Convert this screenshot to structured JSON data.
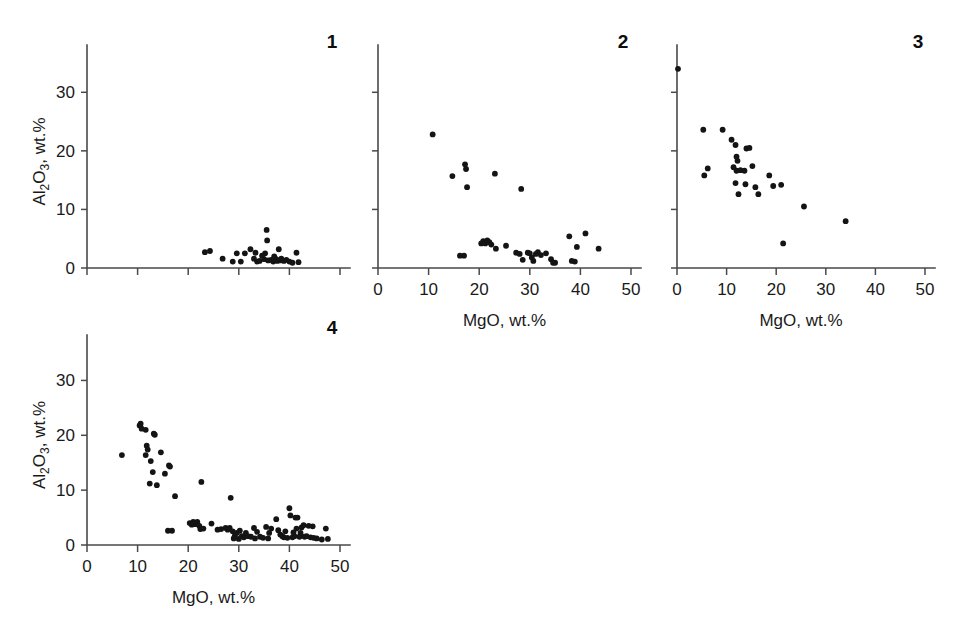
{
  "figure": {
    "title": "",
    "axis_labels": {
      "x": "MgO, wt.%",
      "y_prefix": "Al",
      "y_sub1": "2",
      "y_mid": "O",
      "y_sub2": "3",
      "y_suffix": ", wt.%"
    },
    "y_axis_label_full": "Al2O3, wt.%",
    "x_axis_label_full": "MgO, wt.%"
  },
  "chart_data": [
    {
      "type": "scatter",
      "title": "1",
      "panel_number": "1",
      "xlabel": "",
      "ylabel": "Al2O3, wt.%",
      "xlim": [
        0,
        50
      ],
      "ylim": [
        0,
        35
      ],
      "xticks": [
        0,
        10,
        20,
        30,
        40,
        50
      ],
      "xticklabels": [
        "",
        "",
        "",
        "",
        "",
        ""
      ],
      "yticks": [
        0,
        10,
        20,
        30
      ],
      "yticklabels": [
        "0",
        "10",
        "20",
        "30"
      ],
      "grid": false,
      "legend": "none",
      "points": [
        [
          23.3,
          2.7
        ],
        [
          24.3,
          2.9
        ],
        [
          26.8,
          1.6
        ],
        [
          28.8,
          1.1
        ],
        [
          29.6,
          2.5
        ],
        [
          31.2,
          2.5
        ],
        [
          32.3,
          3.2
        ],
        [
          33.0,
          1.6
        ],
        [
          33.6,
          1.1
        ],
        [
          34.1,
          1.2
        ],
        [
          35.5,
          6.5
        ],
        [
          35.6,
          4.7
        ],
        [
          35.2,
          2.5
        ],
        [
          35.0,
          1.5
        ],
        [
          35.8,
          1.3
        ],
        [
          36.4,
          1.4
        ],
        [
          36.8,
          1.1
        ],
        [
          37.0,
          2.0
        ],
        [
          37.4,
          1.5
        ],
        [
          37.6,
          1.2
        ],
        [
          37.9,
          3.2
        ],
        [
          38.1,
          1.3
        ],
        [
          38.4,
          1.6
        ],
        [
          38.9,
          1.2
        ],
        [
          39.4,
          1.4
        ],
        [
          40.0,
          1.1
        ],
        [
          40.6,
          0.9
        ],
        [
          41.4,
          2.6
        ],
        [
          41.8,
          1.0
        ],
        [
          34.6,
          2.1
        ],
        [
          33.3,
          2.6
        ],
        [
          30.4,
          1.1
        ]
      ]
    },
    {
      "type": "scatter",
      "title": "2",
      "panel_number": "2",
      "xlabel": "MgO, wt.%",
      "ylabel": "",
      "xlim": [
        0,
        50
      ],
      "ylim": [
        0,
        35
      ],
      "xticks": [
        0,
        10,
        20,
        30,
        40,
        50
      ],
      "xticklabels": [
        "0",
        "10",
        "20",
        "30",
        "40",
        "50"
      ],
      "yticks": [
        0,
        10,
        20,
        30
      ],
      "yticklabels": [
        "",
        "",
        "",
        ""
      ],
      "grid": false,
      "legend": "none",
      "points": [
        [
          10.8,
          22.8
        ],
        [
          14.7,
          15.7
        ],
        [
          17.2,
          17.7
        ],
        [
          17.4,
          16.9
        ],
        [
          17.6,
          13.8
        ],
        [
          23.1,
          16.1
        ],
        [
          28.3,
          13.5
        ],
        [
          16.2,
          2.1
        ],
        [
          17.0,
          2.1
        ],
        [
          20.4,
          4.2
        ],
        [
          20.8,
          4.6
        ],
        [
          21.2,
          4.2
        ],
        [
          21.6,
          4.7
        ],
        [
          22.0,
          4.4
        ],
        [
          22.4,
          4.0
        ],
        [
          23.3,
          3.3
        ],
        [
          25.3,
          3.8
        ],
        [
          27.3,
          2.6
        ],
        [
          28.0,
          2.4
        ],
        [
          28.6,
          1.4
        ],
        [
          29.6,
          2.6
        ],
        [
          30.0,
          2.5
        ],
        [
          30.4,
          1.8
        ],
        [
          30.7,
          1.2
        ],
        [
          31.2,
          2.4
        ],
        [
          31.6,
          2.7
        ],
        [
          32.2,
          2.2
        ],
        [
          33.2,
          2.5
        ],
        [
          34.2,
          1.5
        ],
        [
          34.6,
          0.9
        ],
        [
          35.0,
          0.9
        ],
        [
          37.8,
          5.4
        ],
        [
          38.3,
          1.2
        ],
        [
          38.9,
          1.1
        ],
        [
          39.3,
          3.6
        ],
        [
          41.0,
          5.9
        ],
        [
          43.6,
          3.3
        ]
      ]
    },
    {
      "type": "scatter",
      "title": "3",
      "panel_number": "3",
      "xlabel": "MgO, wt.%",
      "ylabel": "",
      "xlim": [
        0,
        50
      ],
      "ylim": [
        0,
        35
      ],
      "xticks": [
        0,
        10,
        20,
        30,
        40,
        50
      ],
      "xticklabels": [
        "0",
        "10",
        "20",
        "30",
        "40",
        "50"
      ],
      "yticks": [
        0,
        10,
        20,
        30
      ],
      "yticklabels": [
        "",
        "",
        "",
        ""
      ],
      "grid": false,
      "legend": "none",
      "points": [
        [
          0.2,
          34.0
        ],
        [
          5.3,
          23.6
        ],
        [
          9.2,
          23.6
        ],
        [
          11.0,
          21.9
        ],
        [
          11.8,
          21.0
        ],
        [
          14.0,
          20.4
        ],
        [
          14.6,
          20.5
        ],
        [
          6.2,
          17.0
        ],
        [
          5.5,
          15.8
        ],
        [
          12.0,
          19.0
        ],
        [
          12.2,
          18.3
        ],
        [
          11.4,
          17.2
        ],
        [
          12.0,
          16.6
        ],
        [
          12.8,
          16.7
        ],
        [
          13.6,
          16.6
        ],
        [
          15.2,
          17.4
        ],
        [
          18.6,
          15.8
        ],
        [
          11.8,
          14.5
        ],
        [
          13.8,
          14.3
        ],
        [
          15.8,
          13.8
        ],
        [
          19.4,
          14.0
        ],
        [
          21.0,
          14.2
        ],
        [
          12.4,
          12.6
        ],
        [
          16.4,
          12.6
        ],
        [
          25.6,
          10.5
        ],
        [
          34.0,
          8.0
        ],
        [
          21.4,
          4.2
        ]
      ]
    },
    {
      "type": "scatter",
      "title": "4",
      "panel_number": "4",
      "xlabel": "MgO, wt.%",
      "ylabel": "Al2O3, wt.%",
      "xlim": [
        0,
        50
      ],
      "ylim": [
        0,
        35
      ],
      "xticks": [
        0,
        10,
        20,
        30,
        40,
        50
      ],
      "xticklabels": [
        "0",
        "10",
        "20",
        "30",
        "40",
        "50"
      ],
      "yticks": [
        0,
        10,
        20,
        30
      ],
      "yticklabels": [
        "0",
        "10",
        "20",
        "30"
      ],
      "grid": false,
      "legend": "none",
      "points": [
        [
          10.4,
          21.8
        ],
        [
          10.6,
          22.1
        ],
        [
          10.8,
          21.2
        ],
        [
          11.6,
          21.0
        ],
        [
          13.2,
          20.3
        ],
        [
          13.4,
          20.1
        ],
        [
          11.8,
          18.1
        ],
        [
          12.0,
          17.4
        ],
        [
          11.6,
          16.4
        ],
        [
          14.6,
          16.9
        ],
        [
          6.9,
          16.4
        ],
        [
          12.6,
          15.3
        ],
        [
          16.2,
          14.5
        ],
        [
          16.4,
          14.3
        ],
        [
          13.0,
          13.3
        ],
        [
          15.4,
          13.0
        ],
        [
          12.4,
          11.2
        ],
        [
          13.8,
          10.9
        ],
        [
          22.6,
          11.5
        ],
        [
          17.4,
          8.9
        ],
        [
          28.4,
          8.6
        ],
        [
          16.0,
          2.6
        ],
        [
          16.8,
          2.6
        ],
        [
          20.3,
          4.0
        ],
        [
          20.7,
          3.7
        ],
        [
          21.0,
          4.2
        ],
        [
          21.4,
          3.8
        ],
        [
          21.8,
          4.2
        ],
        [
          22.2,
          3.5
        ],
        [
          22.4,
          2.9
        ],
        [
          23.0,
          3.0
        ],
        [
          24.6,
          3.9
        ],
        [
          26.5,
          2.9
        ],
        [
          27.4,
          3.1
        ],
        [
          27.8,
          2.8
        ],
        [
          28.2,
          3.1
        ],
        [
          28.8,
          2.5
        ],
        [
          29.2,
          1.6
        ],
        [
          29.6,
          2.2
        ],
        [
          30.2,
          2.6
        ],
        [
          30.6,
          1.6
        ],
        [
          31.0,
          1.4
        ],
        [
          31.4,
          2.2
        ],
        [
          31.8,
          1.6
        ],
        [
          32.4,
          1.5
        ],
        [
          33.0,
          3.1
        ],
        [
          33.6,
          2.4
        ],
        [
          34.2,
          1.5
        ],
        [
          34.8,
          1.3
        ],
        [
          35.4,
          3.3
        ],
        [
          36.4,
          3.0
        ],
        [
          37.4,
          4.7
        ],
        [
          37.8,
          2.7
        ],
        [
          38.2,
          1.9
        ],
        [
          38.6,
          1.6
        ],
        [
          38.9,
          1.4
        ],
        [
          39.2,
          2.5
        ],
        [
          39.6,
          1.3
        ],
        [
          40.0,
          6.7
        ],
        [
          40.2,
          5.4
        ],
        [
          40.6,
          1.4
        ],
        [
          41.0,
          1.6
        ],
        [
          41.2,
          5.0
        ],
        [
          41.6,
          5.0
        ],
        [
          41.4,
          3.0
        ],
        [
          42.0,
          1.5
        ],
        [
          42.4,
          3.2
        ],
        [
          42.8,
          3.6
        ],
        [
          43.0,
          1.5
        ],
        [
          43.4,
          1.6
        ],
        [
          43.8,
          3.5
        ],
        [
          44.2,
          1.4
        ],
        [
          44.6,
          3.4
        ],
        [
          44.8,
          1.3
        ],
        [
          45.4,
          1.2
        ],
        [
          46.4,
          1.0
        ],
        [
          47.2,
          3.0
        ],
        [
          47.6,
          1.1
        ],
        [
          25.8,
          2.8
        ],
        [
          35.8,
          1.2
        ],
        [
          36.0,
          2.2
        ],
        [
          33.2,
          1.2
        ],
        [
          30.0,
          1.1
        ],
        [
          29.0,
          1.2
        ],
        [
          40.8,
          2.3
        ],
        [
          42.2,
          2.2
        ]
      ]
    }
  ]
}
